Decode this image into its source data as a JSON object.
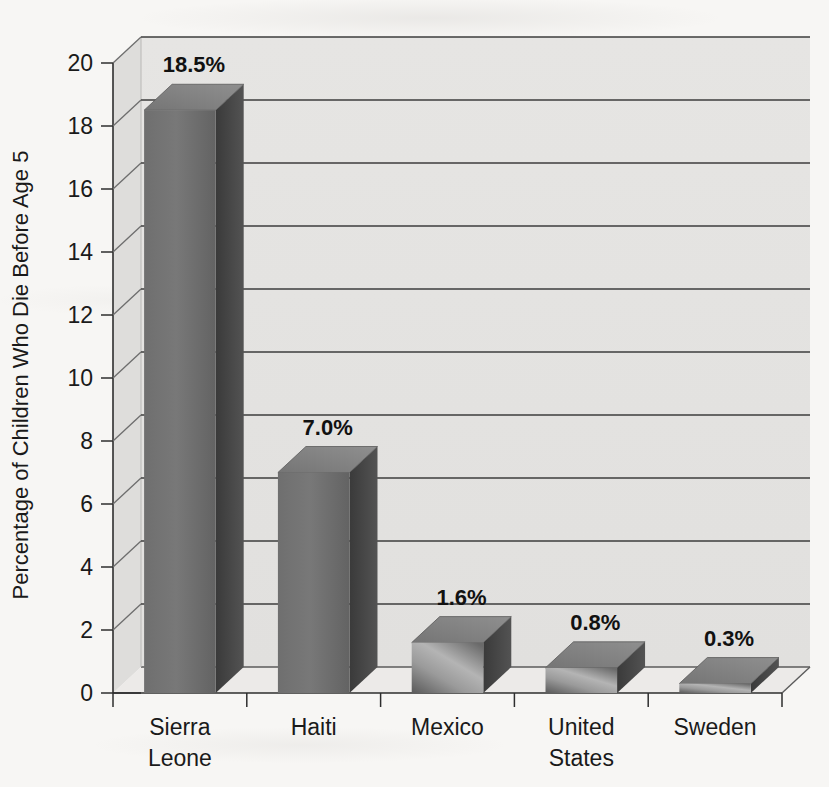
{
  "chart_data": {
    "type": "bar",
    "title": "",
    "subtitle": "",
    "xlabel": "",
    "ylabel": "Percentage of Children Who Die Before Age 5",
    "categories": [
      "Sierra Leone",
      "Haiti",
      "Mexico",
      "United States",
      "Sweden"
    ],
    "values": [
      18.5,
      7.0,
      1.6,
      0.8,
      0.3
    ],
    "data_labels": [
      "18.5%",
      "7.0%",
      "1.6%",
      "0.8%",
      "0.3%"
    ],
    "ylim": [
      0,
      20
    ],
    "ytick_step": 2,
    "ytick_labels": [
      "0",
      "2",
      "4",
      "6",
      "8",
      "10",
      "12",
      "14",
      "16",
      "18",
      "20"
    ],
    "grid": true,
    "grid_axis": "y",
    "legend": false,
    "legend_position": "none",
    "style": "3d-column",
    "colors": {
      "bar_front": "#6e6e6e",
      "bar_side": "#454545",
      "bar_top": "#8c8c8c",
      "plot_wall": "#e4e4e2",
      "floor": "#ebeae8",
      "gridline": "#3c3c3c",
      "axis": "#2e2e2e",
      "text": "#1a1a1a",
      "page_background": "#f7f6f4"
    }
  },
  "category_labels_wrapped": [
    [
      "Sierra",
      "Leone"
    ],
    [
      "Haiti"
    ],
    [
      "Mexico"
    ],
    [
      "United",
      "States"
    ],
    [
      "Sweden"
    ]
  ]
}
